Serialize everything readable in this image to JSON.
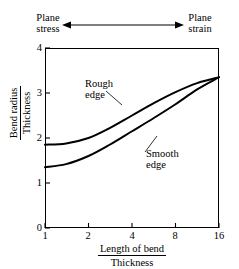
{
  "annotations": {
    "regime_left": "Plane\nstress",
    "regime_left_line1": "Plane",
    "regime_left_line2": "stress",
    "regime_right_line1": "Plane",
    "regime_right_line2": "strain",
    "arrow_name": "double-headed-arrow"
  },
  "axes": {
    "ylabel_numerator": "Bend radius",
    "ylabel_denominator": "Thickness",
    "xlabel_numerator": "Length of bend",
    "xlabel_denominator": "Thickness"
  },
  "chart_data": {
    "type": "line",
    "title": "",
    "subtitle": "",
    "xlabel": "Length of bend / Thickness",
    "ylabel": "Bend radius / Thickness",
    "xscale": "log2",
    "xlim": [
      1,
      16
    ],
    "ylim": [
      0,
      4
    ],
    "xticks": [
      1,
      2,
      4,
      8,
      16
    ],
    "xtick_labels": [
      "1",
      "2",
      "4",
      "8",
      "16"
    ],
    "yticks": [
      0,
      1,
      2,
      3,
      4
    ],
    "ytick_labels": [
      "0",
      "1",
      "2",
      "3",
      "4"
    ],
    "grid": false,
    "legend": "inline-callouts",
    "legend_position": "in-plot",
    "x": [
      1,
      1.4,
      2,
      2.8,
      4,
      5.7,
      8,
      11.3,
      16
    ],
    "series": [
      {
        "name": "Rough edge",
        "label": "Rough\nedge",
        "label_line1": "Rough",
        "label_line2": "edge",
        "color": "#000000",
        "values": [
          1.85,
          1.88,
          2.0,
          2.22,
          2.5,
          2.78,
          3.02,
          3.22,
          3.35
        ]
      },
      {
        "name": "Smooth edge",
        "label": "Smooth\nedge",
        "label_line1": "Smooth",
        "label_line2": "edge",
        "color": "#000000",
        "values": [
          1.35,
          1.42,
          1.6,
          1.85,
          2.15,
          2.45,
          2.75,
          3.08,
          3.35
        ]
      }
    ],
    "annotations": [
      {
        "text": "Plane stress",
        "position": "top-left"
      },
      {
        "text": "Plane strain",
        "position": "top-right"
      }
    ]
  }
}
